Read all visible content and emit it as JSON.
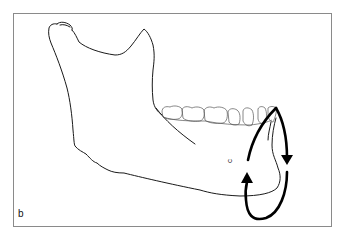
{
  "figure": {
    "panel_label": "b",
    "point_label": "c",
    "colors": {
      "outline": "#1a1a1a",
      "teeth": "#555555",
      "arrows": "#000000",
      "frame": "#8a8a8a",
      "background": "#ffffff"
    },
    "elements": [
      {
        "name": "mandible-outline"
      },
      {
        "name": "teeth-row",
        "count": 7
      },
      {
        "name": "rotation-arrow-down"
      },
      {
        "name": "rotation-arrow-up"
      }
    ]
  }
}
